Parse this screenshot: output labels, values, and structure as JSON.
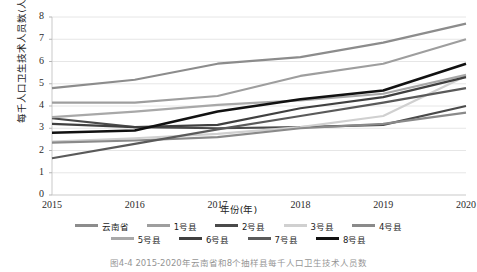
{
  "figure": {
    "caption": "图4-4  2015-2020年云南省和8个抽样县每千人口卫生技术人员数"
  },
  "axes": {
    "ylabel": "每千人口卫生技术人员数(人)",
    "xlabel": "年份(年)",
    "yticks": [
      "8",
      "7",
      "6",
      "5",
      "4",
      "3",
      "2",
      "1",
      "0"
    ],
    "xticks": [
      "2015",
      "2016",
      "2017",
      "2018",
      "2019",
      "2020"
    ]
  },
  "legend": {
    "rows": [
      [
        {
          "label": "云南省",
          "color": "#8c8c8c"
        },
        {
          "label": "1号县",
          "color": "#9e9e9e"
        },
        {
          "label": "2号县",
          "color": "#4a4a4a"
        },
        {
          "label": "3号县",
          "color": "#d0d0d0"
        },
        {
          "label": "4号县",
          "color": "#8a8a8a"
        }
      ],
      [
        {
          "label": "5号县",
          "color": "#a8a8a8"
        },
        {
          "label": "6号县",
          "color": "#404040"
        },
        {
          "label": "7号县",
          "color": "#5a5a5a"
        },
        {
          "label": "8号县",
          "color": "#111111"
        }
      ]
    ]
  },
  "chart_data": {
    "type": "line",
    "title": "",
    "xlabel": "年份(年)",
    "ylabel": "每千人口卫生技术人员数(人)",
    "x": [
      2015,
      2016,
      2017,
      2018,
      2019,
      2020
    ],
    "ylim": [
      0,
      8
    ],
    "xlim": [
      2015,
      2020
    ],
    "grid": "horizontal",
    "legend_position": "bottom",
    "series": [
      {
        "name": "云南省",
        "color": "#8c8c8c",
        "width": 2.2,
        "values": [
          4.8,
          5.18,
          5.9,
          6.2,
          6.85,
          7.7
        ]
      },
      {
        "name": "1号县",
        "color": "#9e9e9e",
        "width": 2.2,
        "values": [
          4.15,
          4.15,
          4.45,
          5.35,
          5.9,
          7.0
        ]
      },
      {
        "name": "2号县",
        "color": "#4a4a4a",
        "width": 2.2,
        "values": [
          3.45,
          3.05,
          3.0,
          3.05,
          3.15,
          4.0
        ]
      },
      {
        "name": "3号县",
        "color": "#d0d0d0",
        "width": 2.2,
        "values": [
          2.4,
          2.55,
          2.75,
          3.05,
          3.55,
          5.35
        ]
      },
      {
        "name": "4号县",
        "color": "#8a8a8a",
        "width": 2.2,
        "values": [
          2.35,
          2.45,
          2.6,
          3.0,
          3.2,
          3.7
        ]
      },
      {
        "name": "5号县",
        "color": "#a8a8a8",
        "width": 2.2,
        "values": [
          3.5,
          3.75,
          4.05,
          4.25,
          4.55,
          5.4
        ]
      },
      {
        "name": "6号县",
        "color": "#404040",
        "width": 2.2,
        "values": [
          3.2,
          3.05,
          3.15,
          3.9,
          4.4,
          5.3
        ]
      },
      {
        "name": "7号县",
        "color": "#5a5a5a",
        "width": 2.2,
        "values": [
          1.65,
          2.3,
          2.95,
          3.55,
          4.15,
          4.8
        ]
      },
      {
        "name": "8号县",
        "color": "#111111",
        "width": 2.6,
        "values": [
          2.8,
          2.9,
          3.75,
          4.3,
          4.7,
          5.9
        ]
      }
    ]
  }
}
